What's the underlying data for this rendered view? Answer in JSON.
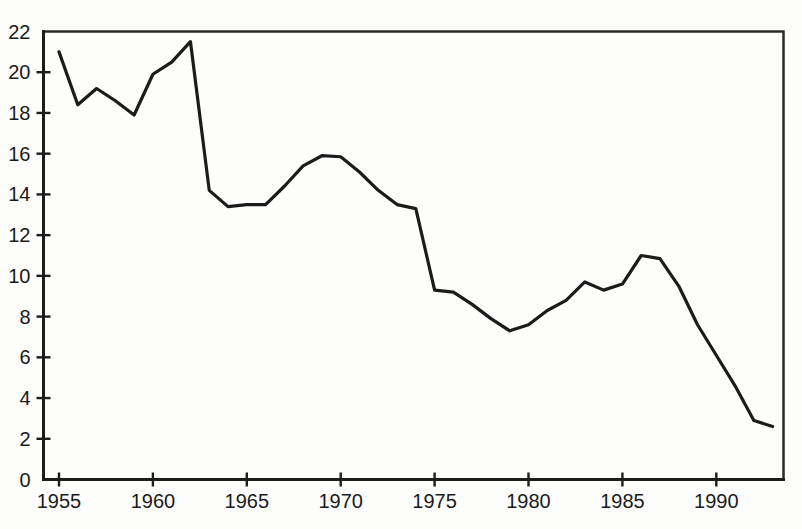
{
  "chart_data": {
    "type": "line",
    "title": "",
    "subtitle": "",
    "xlabel": "",
    "ylabel": "",
    "xlim": [
      1955,
      1993
    ],
    "ylim": [
      0,
      22
    ],
    "grid": false,
    "legend": null,
    "x_ticks": [
      "1955",
      "1960",
      "1965",
      "1970",
      "1975",
      "1980",
      "1985",
      "1990"
    ],
    "x_tick_values": [
      1955,
      1960,
      1965,
      1970,
      1975,
      1980,
      1985,
      1990
    ],
    "y_ticks": [
      "0",
      "2",
      "4",
      "6",
      "8",
      "10",
      "12",
      "14",
      "16",
      "18",
      "20",
      "22"
    ],
    "y_tick_values": [
      0,
      2,
      4,
      6,
      8,
      10,
      12,
      14,
      16,
      18,
      20,
      22
    ],
    "line_color": "#1b1b1b",
    "x": [
      1955,
      1956,
      1957,
      1958,
      1959,
      1960,
      1961,
      1962,
      1963,
      1964,
      1965,
      1966,
      1967,
      1968,
      1969,
      1970,
      1971,
      1972,
      1973,
      1974,
      1975,
      1976,
      1977,
      1978,
      1979,
      1980,
      1981,
      1982,
      1983,
      1984,
      1985,
      1986,
      1987,
      1988,
      1989,
      1990,
      1991,
      1992,
      1993
    ],
    "values": [
      21.0,
      18.4,
      19.2,
      18.6,
      17.9,
      19.9,
      20.5,
      21.5,
      14.2,
      13.4,
      13.5,
      13.5,
      14.4,
      15.4,
      15.9,
      15.85,
      15.1,
      14.2,
      13.5,
      13.3,
      9.3,
      9.2,
      8.6,
      7.9,
      7.3,
      7.6,
      8.3,
      8.8,
      9.7,
      9.3,
      9.6,
      11.0,
      10.85,
      9.5,
      7.6,
      6.1,
      4.6,
      2.9,
      2.6
    ]
  },
  "axes": {
    "y_axis_name": "y-axis",
    "x_axis_name": "x-axis"
  }
}
